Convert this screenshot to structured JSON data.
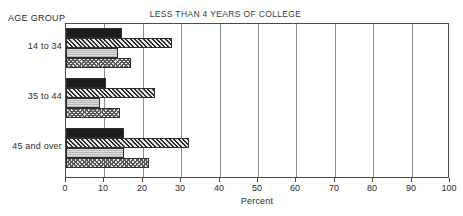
{
  "chart_data": {
    "type": "bar",
    "orientation": "horizontal",
    "title": "LESS THAN 4 YEARS OF COLLEGE",
    "xlabel": "Percent",
    "ylabel": "AGE GROUP",
    "xlim": [
      0,
      100
    ],
    "xticks": [
      0,
      10,
      20,
      30,
      40,
      50,
      60,
      70,
      80,
      90,
      100
    ],
    "xtick_labels": [
      "0",
      "10",
      "20",
      "30",
      "40",
      "50",
      "60",
      "70",
      "80",
      "90",
      "100"
    ],
    "grid": "vertical",
    "legend": "none",
    "categories": [
      "14 to 34",
      "35 to 44",
      "45 and over"
    ],
    "series": [
      {
        "name": "series-1",
        "pattern": "solid-dark",
        "values": [
          14.6,
          10.4,
          15.1
        ]
      },
      {
        "name": "series-2",
        "pattern": "diagonal-hatch-dark",
        "values": [
          27.5,
          23.2,
          32.0
        ]
      },
      {
        "name": "series-3",
        "pattern": "light-gray",
        "values": [
          13.5,
          8.8,
          15.1
        ]
      },
      {
        "name": "series-4",
        "pattern": "checkered-mid",
        "values": [
          17.0,
          14.0,
          21.5
        ]
      }
    ]
  },
  "axis": {
    "group_caption": "AGE GROUP",
    "x_title": "Percent"
  },
  "colors": {
    "series_1": "#1c1c1c",
    "series_2": "#2a2a2a",
    "series_3": "#b7b7b7",
    "series_4": "#585858",
    "grid": "#8c8c8c",
    "frame": "#4a4a4a",
    "text": "#2b2b2b",
    "background": "#ffffff"
  }
}
